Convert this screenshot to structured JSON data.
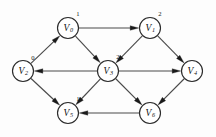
{
  "diagram": {
    "type": "directed-graph",
    "colors": {
      "background": "#fdfdfd",
      "node_fill": "#ffffff",
      "node_stroke": "#2b2b2b",
      "edge": "#4a4a4a",
      "arrow": "#1a1a1a",
      "text": "#111111"
    },
    "node_radius": 10.5,
    "nodes": [
      {
        "id": "V0",
        "base": "V",
        "sub": "0",
        "weight": "1",
        "x": 68,
        "y": 28,
        "weight_dx": 10,
        "weight_dy": -12
      },
      {
        "id": "V1",
        "base": "V",
        "sub": "1",
        "weight": "2",
        "x": 150,
        "y": 28,
        "weight_dx": 10,
        "weight_dy": -12
      },
      {
        "id": "V2",
        "base": "V",
        "sub": "2",
        "weight": "0",
        "x": 23,
        "y": 71,
        "weight_dx": 10,
        "weight_dy": -11
      },
      {
        "id": "V3",
        "base": "V",
        "sub": "3",
        "weight": "2",
        "x": 108,
        "y": 71,
        "weight_dx": 10,
        "weight_dy": -12
      },
      {
        "id": "V4",
        "base": "V",
        "sub": "4",
        "weight": "",
        "x": 192,
        "y": 71,
        "weight_dx": 10,
        "weight_dy": -12
      },
      {
        "id": "V5",
        "base": "V",
        "sub": "5",
        "weight": "1",
        "x": 68,
        "y": 113,
        "weight_dx": 10,
        "weight_dy": -12
      },
      {
        "id": "V6",
        "base": "V",
        "sub": "6",
        "weight": "",
        "x": 150,
        "y": 113,
        "weight_dx": 10,
        "weight_dy": -12
      }
    ],
    "edges": [
      {
        "from": "V0",
        "to": "V1",
        "name": "edge-v0-v1"
      },
      {
        "from": "V0",
        "to": "V3",
        "name": "edge-v0-v3"
      },
      {
        "from": "V1",
        "to": "V3",
        "name": "edge-v1-v3"
      },
      {
        "from": "V1",
        "to": "V4",
        "name": "edge-v1-v4"
      },
      {
        "from": "V2",
        "to": "V0",
        "name": "edge-v2-v0"
      },
      {
        "from": "V2",
        "to": "V5",
        "name": "edge-v2-v5"
      },
      {
        "from": "V3",
        "to": "V2",
        "name": "edge-v3-v2"
      },
      {
        "from": "V3",
        "to": "V4",
        "name": "edge-v3-v4"
      },
      {
        "from": "V3",
        "to": "V5",
        "name": "edge-v3-v5"
      },
      {
        "from": "V3",
        "to": "V6",
        "name": "edge-v3-v6"
      },
      {
        "from": "V4",
        "to": "V6",
        "name": "edge-v4-v6"
      },
      {
        "from": "V6",
        "to": "V5",
        "name": "edge-v6-v5"
      }
    ]
  }
}
